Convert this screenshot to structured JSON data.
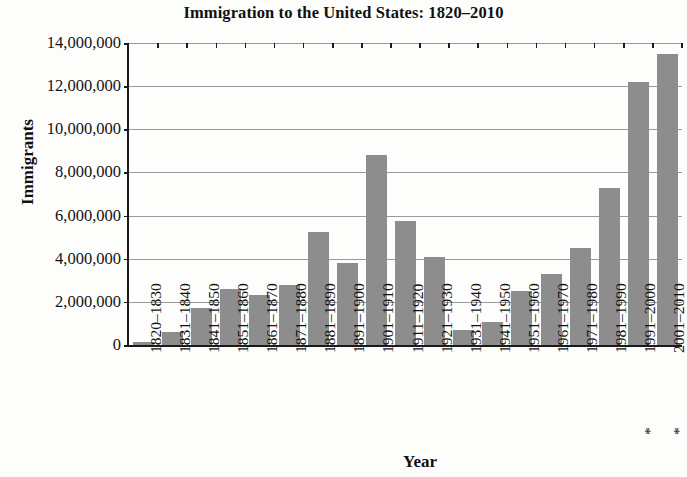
{
  "chart_data": {
    "type": "bar",
    "title": "Immigration to the United States: 1820–2010",
    "xlabel": "Year",
    "ylabel": "Immigrants",
    "ylim": [
      0,
      14000000
    ],
    "ytick_step": 2000000,
    "grid": true,
    "legend": "none",
    "bar_color": "#8d8d8d",
    "axis_color": "#1a1a1a",
    "gridline_color": "#9a9a9a",
    "footnote_marker": "*",
    "categories": [
      "1820–1830",
      "1831–1840",
      "1841–1850",
      "1851–1860",
      "1861–1870",
      "1871–1880",
      "1881–1890",
      "1891–1900",
      "1901–1910",
      "1911–1920",
      "1921–1930",
      "1931–1940",
      "1941–1950",
      "1951–1960",
      "1961–1970",
      "1971–1980",
      "1981–1990",
      "*1991–2000",
      "*2001–2010"
    ],
    "values": [
      150000,
      600000,
      1700000,
      2600000,
      2300000,
      2800000,
      5250000,
      3800000,
      8800000,
      5750000,
      4100000,
      700000,
      1050000,
      2500000,
      3300000,
      4500000,
      7300000,
      12200000,
      13500000
    ],
    "ytick_labels": [
      "0",
      "2,000,000",
      "4,000,000",
      "6,000,000",
      "8,000,000",
      "10,000,000",
      "12,000,000",
      "14,000,000"
    ],
    "ytick_values": [
      0,
      2000000,
      4000000,
      6000000,
      8000000,
      10000000,
      12000000,
      14000000
    ]
  }
}
